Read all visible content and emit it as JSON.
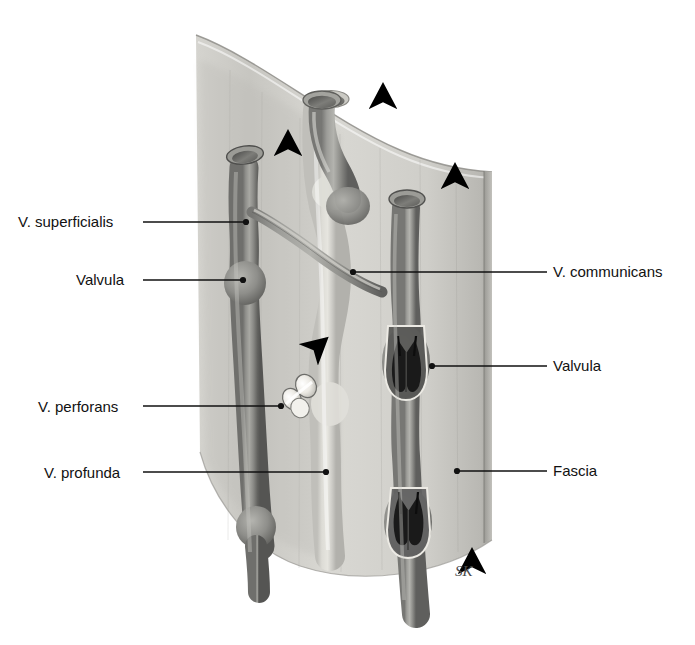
{
  "figure": {
    "signature": "SK",
    "background_color": "#ffffff",
    "ink_color": "#111111",
    "fascia_color": "#cfcfcb",
    "vein_dark_color": "#8d8d8a",
    "vein_light_color": "#d8d6d0"
  },
  "labels": {
    "left": [
      {
        "id": "v-superficialis",
        "text": "V. superficialis",
        "text_x": 18,
        "text_y": 227,
        "line_x1": 143,
        "line_y1": 222,
        "line_x2": 246,
        "line_y2": 222,
        "dot_x": 246,
        "dot_y": 222
      },
      {
        "id": "valvula-left",
        "text": "Valvula",
        "text_x": 76,
        "text_y": 285,
        "line_x1": 143,
        "line_y1": 280,
        "line_x2": 243,
        "line_y2": 280,
        "dot_x": 243,
        "dot_y": 280
      },
      {
        "id": "v-perforans",
        "text": "V. perforans",
        "text_x": 38,
        "text_y": 412,
        "line_x1": 143,
        "line_y1": 406,
        "line_x2": 281,
        "line_y2": 406,
        "dot_x": 281,
        "dot_y": 406
      },
      {
        "id": "v-profunda",
        "text": "V. profunda",
        "text_x": 44,
        "text_y": 478,
        "line_x1": 143,
        "line_y1": 472,
        "line_x2": 326,
        "line_y2": 472,
        "dot_x": 326,
        "dot_y": 472
      }
    ],
    "right": [
      {
        "id": "v-communicans",
        "text": "V. communicans",
        "text_x": 553,
        "text_y": 277,
        "line_x1": 547,
        "line_y1": 272,
        "line_x2": 353,
        "line_y2": 272,
        "dot_x": 353,
        "dot_y": 272
      },
      {
        "id": "valvula-right",
        "text": "Valvula",
        "text_x": 553,
        "text_y": 371,
        "line_x1": 547,
        "line_y1": 366,
        "line_x2": 432,
        "line_y2": 366,
        "dot_x": 432,
        "dot_y": 366
      },
      {
        "id": "fascia",
        "text": "Fascia",
        "text_x": 553,
        "text_y": 476,
        "line_x1": 547,
        "line_y1": 471,
        "line_x2": 457,
        "line_y2": 471,
        "dot_x": 457,
        "dot_y": 471
      }
    ]
  },
  "flow_arrows": [
    {
      "id": "arrow-fascia-left",
      "x": 288,
      "y1": 192,
      "y2": 140,
      "direction": "up"
    },
    {
      "id": "arrow-deep-vein",
      "x": 383,
      "y1": 152,
      "y2": 93,
      "direction": "up"
    },
    {
      "id": "arrow-fascia-right",
      "x": 455,
      "y1": 232,
      "y2": 173,
      "direction": "up"
    },
    {
      "id": "arrow-bottom-right",
      "x": 472,
      "y1": 613,
      "y2": 558,
      "direction": "up"
    },
    {
      "id": "arrow-perforator",
      "x1": 290,
      "y1": 372,
      "x2": 320,
      "y2": 344,
      "direction": "up-right"
    }
  ]
}
